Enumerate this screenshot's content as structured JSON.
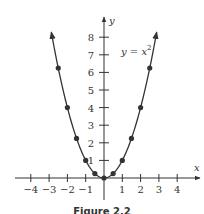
{
  "chart_data": {
    "type": "line",
    "title": "",
    "equation_label": "y = x",
    "equation_exponent": "2",
    "xlabel": "x",
    "ylabel": "y",
    "xlim": [
      -4.5,
      5.2
    ],
    "ylim": [
      0,
      9
    ],
    "x_ticks": [
      -4,
      -3,
      -2,
      -1,
      1,
      2,
      3,
      4
    ],
    "x_tick_labels": [
      "−4",
      "−3",
      "−2",
      "−1",
      "1",
      "2",
      "3",
      "4"
    ],
    "y_ticks": [
      1,
      2,
      3,
      4,
      5,
      6,
      7,
      8
    ],
    "y_tick_labels": [
      "1",
      "2",
      "3",
      "4",
      "5",
      "6",
      "7",
      "8"
    ],
    "grid": false,
    "series": [
      {
        "name": "y = x^2",
        "x": [
          -2.5,
          -2,
          -1.5,
          -1,
          -0.5,
          0,
          0.5,
          1,
          1.5,
          2,
          2.5
        ],
        "y": [
          6.25,
          4,
          2.25,
          1,
          0.25,
          0,
          0.25,
          1,
          2.25,
          4,
          6.25
        ],
        "markers": true,
        "arrows_at_ends": true
      }
    ]
  },
  "caption": "Figure 2.2",
  "colors": {
    "ink": "#333333",
    "background": "#ffffff"
  }
}
